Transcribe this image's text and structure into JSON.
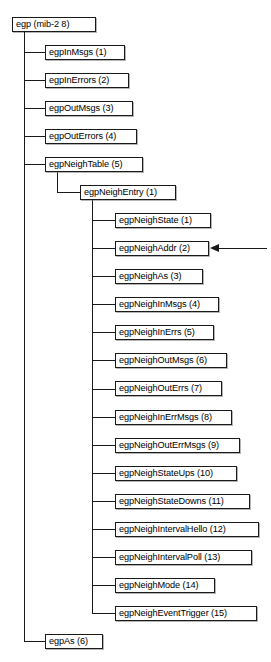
{
  "diagram": {
    "type": "mib-object-tree",
    "title": "egp (mib-2 8)",
    "root": {
      "label": "egp (mib-2 8)",
      "name": "egp",
      "oid_suffix": "mib-2 8",
      "x": 12,
      "y": 18,
      "width": 84
    },
    "nodes": [
      {
        "label": "egpInMsgs (1)",
        "level": 1,
        "index": 1,
        "x": 45,
        "y": 48,
        "width": 80
      },
      {
        "label": "egpInErrors (2)",
        "level": 1,
        "index": 2,
        "x": 45,
        "y": 78,
        "width": 84
      },
      {
        "label": "egpOutMsgs (3)",
        "level": 1,
        "index": 3,
        "x": 45,
        "y": 108,
        "width": 88
      },
      {
        "label": "egpOutErrors (4)",
        "level": 1,
        "index": 4,
        "x": 45,
        "y": 138,
        "width": 92
      },
      {
        "label": "egpNeighTable (5)",
        "level": 1,
        "index": 5,
        "x": 45,
        "y": 168,
        "width": 98
      },
      {
        "label": "egpNeighEntry (1)",
        "level": 2,
        "index": 1,
        "x": 80,
        "y": 198,
        "width": 96
      },
      {
        "label": "egpNeighState (1)",
        "level": 3,
        "index": 1,
        "x": 115,
        "y": 228,
        "width": 96
      },
      {
        "label": "egpNeighAddr (2)",
        "level": 3,
        "index": 2,
        "x": 115,
        "y": 258,
        "width": 94
      },
      {
        "label": "egpNeighAs (3)",
        "level": 3,
        "index": 3,
        "x": 115,
        "y": 288,
        "width": 88
      },
      {
        "label": "egpNeighInMsgs (4)",
        "level": 3,
        "index": 4,
        "x": 115,
        "y": 318,
        "width": 104
      },
      {
        "label": "egpNeighInErrs (5)",
        "level": 3,
        "index": 5,
        "x": 115,
        "y": 348,
        "width": 99
      },
      {
        "label": "egpNeighOutMsgs (6)",
        "level": 3,
        "index": 6,
        "x": 115,
        "y": 378,
        "width": 112
      },
      {
        "label": "egpNeighOutErrs (7)",
        "level": 3,
        "index": 7,
        "x": 115,
        "y": 408,
        "width": 107
      },
      {
        "label": "egpNeighInErrMsgs (8)",
        "level": 3,
        "index": 8,
        "x": 115,
        "y": 438,
        "width": 117
      },
      {
        "label": "egpNeighOutErrMsgs (9)",
        "level": 3,
        "index": 9,
        "x": 115,
        "y": 468,
        "width": 125
      },
      {
        "label": "egpNeighStateUps (10)",
        "level": 3,
        "index": 10,
        "x": 115,
        "y": 498,
        "width": 122
      },
      {
        "label": "egpNeighStateDowns (11)",
        "level": 3,
        "index": 11,
        "x": 115,
        "y": 528,
        "width": 135
      },
      {
        "label": "egpNeighIntervalHello (12)",
        "level": 3,
        "index": 12,
        "x": 115,
        "y": 558,
        "width": 144
      },
      {
        "label": "egpNeighIntervalPoll (13)",
        "level": 3,
        "index": 13,
        "x": 115,
        "y": 588,
        "width": 137
      },
      {
        "label": "egpNeighMode (14)",
        "level": 3,
        "index": 14,
        "x": 115,
        "y": 618,
        "width": 100
      },
      {
        "label": "egpNeighEventTrigger (15)",
        "level": 3,
        "index": 15,
        "x": 115,
        "y": 648,
        "width": 142
      },
      {
        "label": "egpAs (6)",
        "level": 1,
        "index": 6,
        "x": 45,
        "y": 678,
        "width": 58
      }
    ],
    "annotation": {
      "type": "pointer-arrow",
      "target": "egpNeighAddr (2)",
      "direction": "left",
      "x": 212,
      "y": 265,
      "length": 50
    },
    "colors": {
      "stroke": "#1a1a1a",
      "box_fill": "#ffffff",
      "background": "#ffffff",
      "text": "#000000"
    }
  }
}
